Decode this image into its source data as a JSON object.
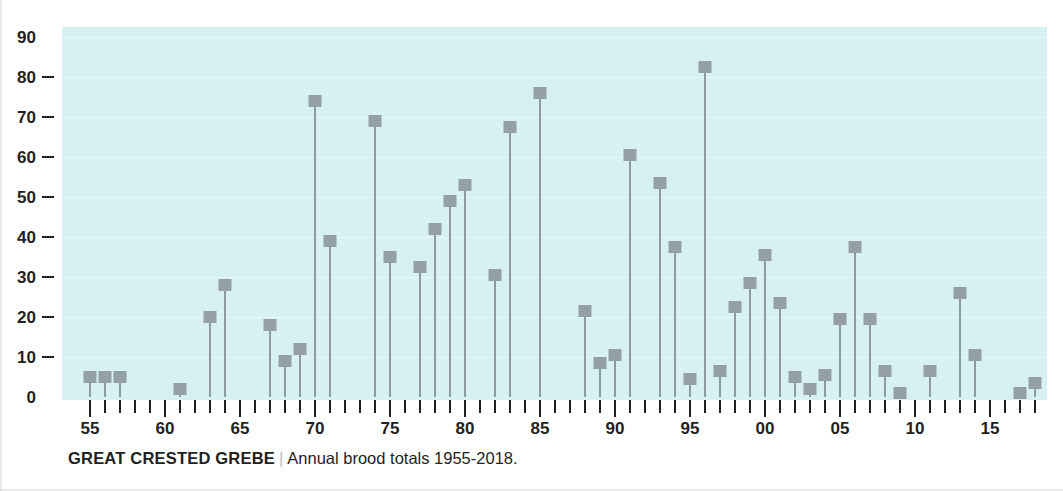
{
  "caption": {
    "species": "GREAT CRESTED GREBE",
    "separator": "|",
    "description": "Annual brood totals 1955-2018."
  },
  "axes": {
    "y_ticks": [
      "0",
      "10",
      "20",
      "30",
      "40",
      "50",
      "60",
      "70",
      "80",
      "90"
    ],
    "x_labels": [
      "55",
      "60",
      "65",
      "70",
      "75",
      "80",
      "85",
      "90",
      "95",
      "00",
      "05",
      "10",
      "15"
    ]
  },
  "colors": {
    "plot_background": "#d7f0f4",
    "gridline": "#e8f7fa",
    "marker": "#949fa8",
    "stem": "#8d9aa3",
    "text": "#231f20"
  },
  "chart_data": {
    "type": "bar",
    "title": "GREAT CRESTED GREBE",
    "subtitle": "Annual brood totals 1955-2018.",
    "xlabel": "",
    "ylabel": "",
    "ylim": [
      0,
      90
    ],
    "xlim": [
      1955,
      2018
    ],
    "grid": true,
    "legend": "none",
    "x_tick_labels": [
      "55",
      "60",
      "65",
      "70",
      "75",
      "80",
      "85",
      "90",
      "95",
      "00",
      "05",
      "10",
      "15"
    ],
    "x_tick_years": [
      1955,
      1960,
      1965,
      1970,
      1975,
      1980,
      1985,
      1990,
      1995,
      2000,
      2005,
      2010,
      2015
    ],
    "categories": [
      1955,
      1956,
      1957,
      1958,
      1959,
      1960,
      1961,
      1962,
      1963,
      1964,
      1965,
      1966,
      1967,
      1968,
      1969,
      1970,
      1971,
      1972,
      1973,
      1974,
      1975,
      1976,
      1977,
      1978,
      1979,
      1980,
      1981,
      1982,
      1983,
      1984,
      1985,
      1986,
      1987,
      1988,
      1989,
      1990,
      1991,
      1992,
      1993,
      1994,
      1995,
      1996,
      1997,
      1998,
      1999,
      2000,
      2001,
      2002,
      2003,
      2004,
      2005,
      2006,
      2007,
      2008,
      2009,
      2010,
      2011,
      2012,
      2013,
      2014,
      2015,
      2016,
      2017,
      2018
    ],
    "values": [
      5,
      5,
      5,
      0,
      0,
      0,
      2,
      0,
      20,
      28,
      0,
      0,
      18,
      9,
      12,
      74,
      39,
      0,
      0,
      69,
      35,
      0,
      32.5,
      42,
      49,
      53,
      0,
      30.5,
      67.5,
      0,
      76,
      0,
      0,
      21.5,
      8.5,
      10.5,
      60.5,
      0,
      53.5,
      37.5,
      4.5,
      82.5,
      6.5,
      22.5,
      28.5,
      35.5,
      23.5,
      5,
      2,
      5.5,
      19.5,
      37.5,
      19.5,
      6.5,
      1,
      0,
      6.5,
      0,
      26,
      10.5,
      0,
      0,
      1,
      3.5
    ]
  }
}
